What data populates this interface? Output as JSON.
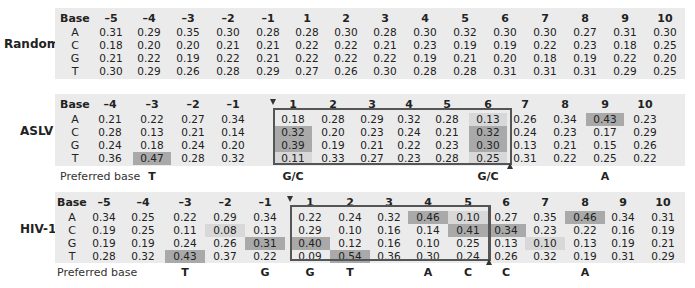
{
  "panels": {
    "random": {
      "label": "Random",
      "base_header": "Base",
      "positions": [
        "–5",
        "–4",
        "–3",
        "–2",
        "–1",
        "1",
        "2",
        "3",
        "4",
        "5",
        "6",
        "7",
        "8",
        "9",
        "10"
      ],
      "bases": [
        "A",
        "C",
        "G",
        "T"
      ],
      "rows": {
        "A": [
          "0.31",
          "0.29",
          "0.35",
          "0.30",
          "0.28",
          "0.28",
          "0.30",
          "0.28",
          "0.30",
          "0.32",
          "0.30",
          "0.30",
          "0.27",
          "0.31",
          "0.30"
        ],
        "C": [
          "0.18",
          "0.20",
          "0.20",
          "0.21",
          "0.21",
          "0.22",
          "0.22",
          "0.21",
          "0.23",
          "0.19",
          "0.19",
          "0.22",
          "0.23",
          "0.18",
          "0.25"
        ],
        "G": [
          "0.21",
          "0.22",
          "0.19",
          "0.22",
          "0.21",
          "0.22",
          "0.22",
          "0.22",
          "0.19",
          "0.21",
          "0.20",
          "0.18",
          "0.19",
          "0.22",
          "0.20"
        ],
        "T": [
          "0.30",
          "0.29",
          "0.26",
          "0.28",
          "0.29",
          "0.27",
          "0.26",
          "0.30",
          "0.28",
          "0.28",
          "0.31",
          "0.31",
          "0.31",
          "0.29",
          "0.25"
        ]
      }
    },
    "aslv": {
      "label": "ASLV",
      "base_header": "Base",
      "positions": [
        "–4",
        "–3",
        "–2",
        "–1",
        "1",
        "2",
        "3",
        "4",
        "5",
        "6",
        "7",
        "8",
        "9",
        "10"
      ],
      "bases": [
        "A",
        "C",
        "G",
        "T"
      ],
      "rows": {
        "A": [
          "0.21",
          "0.22",
          "0.27",
          "0.34",
          "0.18",
          "0.28",
          "0.29",
          "0.32",
          "0.28",
          "0.13",
          "0.26",
          "0.34",
          "0.43",
          "0.23"
        ],
        "C": [
          "0.28",
          "0.13",
          "0.21",
          "0.14",
          "0.32",
          "0.20",
          "0.23",
          "0.24",
          "0.21",
          "0.32",
          "0.24",
          "0.23",
          "0.17",
          "0.29"
        ],
        "G": [
          "0.24",
          "0.18",
          "0.24",
          "0.20",
          "0.39",
          "0.19",
          "0.21",
          "0.22",
          "0.23",
          "0.30",
          "0.13",
          "0.21",
          "0.15",
          "0.26"
        ],
        "T": [
          "0.36",
          "0.47",
          "0.28",
          "0.32",
          "0.11",
          "0.33",
          "0.27",
          "0.23",
          "0.28",
          "0.25",
          "0.31",
          "0.22",
          "0.25",
          "0.22"
        ]
      },
      "preferred_label": "Preferred base",
      "preferred": [
        "",
        "T",
        "",
        "",
        "G/C",
        "",
        "",
        "",
        "",
        "G/C",
        "",
        "",
        "A",
        ""
      ]
    },
    "hiv1": {
      "label": "HIV-1",
      "base_header": "Base",
      "positions": [
        "–5",
        "–4",
        "–3",
        "–2",
        "–1",
        "1",
        "2",
        "3",
        "4",
        "5",
        "6",
        "7",
        "8",
        "9",
        "10"
      ],
      "bases": [
        "A",
        "C",
        "G",
        "T"
      ],
      "rows": {
        "A": [
          "0.34",
          "0.25",
          "0.22",
          "0.29",
          "0.34",
          "0.22",
          "0.24",
          "0.32",
          "0.46",
          "0.10",
          "0.27",
          "0.35",
          "0.46",
          "0.34",
          "0.31"
        ],
        "C": [
          "0.19",
          "0.25",
          "0.11",
          "0.08",
          "0.13",
          "0.29",
          "0.10",
          "0.16",
          "0.14",
          "0.41",
          "0.34",
          "0.23",
          "0.22",
          "0.16",
          "0.19"
        ],
        "G": [
          "0.19",
          "0.19",
          "0.24",
          "0.26",
          "0.31",
          "0.40",
          "0.12",
          "0.16",
          "0.10",
          "0.25",
          "0.13",
          "0.10",
          "0.13",
          "0.19",
          "0.21"
        ],
        "T": [
          "0.28",
          "0.32",
          "0.43",
          "0.37",
          "0.22",
          "0.09",
          "0.54",
          "0.36",
          "0.30",
          "0.24",
          "0.26",
          "0.32",
          "0.19",
          "0.31",
          "0.29"
        ]
      },
      "preferred_label": "Preferred base",
      "preferred": [
        "",
        "",
        "T",
        "",
        "G",
        "G",
        "T",
        "",
        "A",
        "C",
        "C",
        "",
        "A",
        "",
        ""
      ]
    }
  },
  "colors": {
    "panel_bg": "#ebebeb",
    "shade_dark": "#a9a9a9",
    "shade_mid": "#c3c3c3",
    "shade_light": "#d8d8d8",
    "box_border": "#555555"
  }
}
